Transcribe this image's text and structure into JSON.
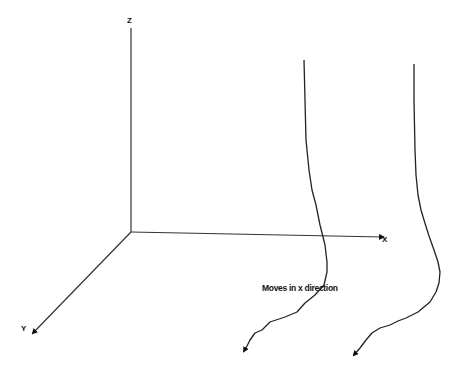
{
  "diagram": {
    "type": "3d-axes-trajectory-sketch",
    "axes": {
      "origin": [
        131,
        232
      ],
      "z": {
        "label": "Z",
        "end": [
          131,
          28
        ],
        "label_pos": [
          127,
          17
        ]
      },
      "x": {
        "label": "X",
        "end": [
          383,
          237
        ],
        "label_pos": [
          382,
          236
        ]
      },
      "y": {
        "label": "Y",
        "end": [
          33,
          333
        ],
        "label_pos": [
          21,
          325
        ]
      }
    },
    "annotation": {
      "text": "Moves in x direction",
      "pos": [
        262,
        284
      ]
    },
    "curves": [
      {
        "name": "trajectory-1",
        "points": [
          [
            304,
            60
          ],
          [
            305,
            100
          ],
          [
            306,
            140
          ],
          [
            309,
            170
          ],
          [
            312,
            190
          ],
          [
            316,
            205
          ],
          [
            320,
            225
          ],
          [
            325,
            245
          ],
          [
            327,
            262
          ],
          [
            327,
            272
          ],
          [
            324,
            285
          ],
          [
            315,
            295
          ],
          [
            305,
            303
          ],
          [
            297,
            312
          ],
          [
            285,
            317
          ],
          [
            270,
            322
          ],
          [
            262,
            330
          ],
          [
            255,
            333
          ],
          [
            250,
            340
          ],
          [
            247,
            346
          ],
          [
            244,
            351
          ]
        ]
      },
      {
        "name": "trajectory-2",
        "points": [
          [
            414,
            64
          ],
          [
            414,
            100
          ],
          [
            415,
            150
          ],
          [
            416,
            175
          ],
          [
            418,
            195
          ],
          [
            421,
            210
          ],
          [
            424,
            220
          ],
          [
            429,
            236
          ],
          [
            434,
            250
          ],
          [
            438,
            262
          ],
          [
            440,
            272
          ],
          [
            439,
            283
          ],
          [
            436,
            292
          ],
          [
            430,
            302
          ],
          [
            418,
            312
          ],
          [
            406,
            318
          ],
          [
            398,
            321
          ],
          [
            390,
            325
          ],
          [
            380,
            328
          ],
          [
            372,
            333
          ],
          [
            366,
            340
          ],
          [
            360,
            348
          ],
          [
            354,
            355
          ]
        ]
      }
    ],
    "colors": {
      "line": "#222222",
      "background": "#ffffff"
    }
  }
}
